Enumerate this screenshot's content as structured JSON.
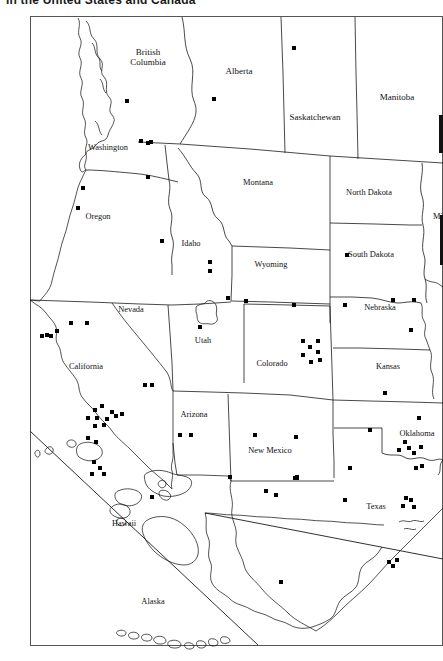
{
  "title": "in the United States and Canada",
  "map": {
    "type": "dot-distribution-map",
    "region": "Western United States and Canada",
    "frame": {
      "x": 30,
      "y": 16,
      "width": 413,
      "height": 630
    },
    "provinces": [
      {
        "name": "British Columbia",
        "x": 148,
        "y": 55,
        "two_line": true,
        "line1": "British",
        "line2": "Columbia"
      },
      {
        "name": "Alberta",
        "x": 239,
        "y": 74
      },
      {
        "name": "Saskatchewan",
        "x": 315,
        "y": 120
      },
      {
        "name": "Manitoba",
        "x": 397,
        "y": 100
      }
    ],
    "states": [
      {
        "name": "Washington",
        "x": 108,
        "y": 150
      },
      {
        "name": "Oregon",
        "x": 98,
        "y": 219
      },
      {
        "name": "Idaho",
        "x": 191,
        "y": 246
      },
      {
        "name": "Montana",
        "x": 258,
        "y": 185
      },
      {
        "name": "North Dakota",
        "x": 369,
        "y": 195
      },
      {
        "name": "South Dakota",
        "x": 371,
        "y": 257
      },
      {
        "name": "Nebraska",
        "x": 380,
        "y": 310
      },
      {
        "name": "Wyoming",
        "x": 271,
        "y": 267
      },
      {
        "name": "Nevada",
        "x": 131,
        "y": 312
      },
      {
        "name": "Utah",
        "x": 203,
        "y": 343
      },
      {
        "name": "Colorado",
        "x": 272,
        "y": 366
      },
      {
        "name": "Kansas",
        "x": 388,
        "y": 369
      },
      {
        "name": "California",
        "x": 86,
        "y": 369
      },
      {
        "name": "Arizona",
        "x": 194,
        "y": 417
      },
      {
        "name": "New Mexico",
        "x": 270,
        "y": 453
      },
      {
        "name": "Oklahoma",
        "x": 417,
        "y": 436
      },
      {
        "name": "Texas",
        "x": 376,
        "y": 509
      },
      {
        "name": "Hawaii",
        "x": 124,
        "y": 526
      },
      {
        "name": "Alaska",
        "x": 153,
        "y": 604
      },
      {
        "name": "Mi",
        "x": 438,
        "y": 219,
        "clipped": true
      }
    ],
    "dots": {
      "marker": "filled-square",
      "size_px": 4,
      "count": 96,
      "points": [
        [
          127,
          101
        ],
        [
          214,
          99
        ],
        [
          294,
          48
        ],
        [
          141,
          141
        ],
        [
          148,
          143
        ],
        [
          151,
          142
        ],
        [
          83,
          188
        ],
        [
          78,
          208
        ],
        [
          162,
          241
        ],
        [
          294,
          305
        ],
        [
          345,
          305
        ],
        [
          347,
          255
        ],
        [
          393,
          300
        ],
        [
          414,
          300
        ],
        [
          411,
          330
        ],
        [
          385,
          393
        ],
        [
          246,
          301
        ],
        [
          228,
          298
        ],
        [
          200,
          327
        ],
        [
          71,
          323
        ],
        [
          87,
          323
        ],
        [
          47,
          335
        ],
        [
          51,
          336
        ],
        [
          57,
          331
        ],
        [
          42,
          336
        ],
        [
          95,
          410
        ],
        [
          102,
          406
        ],
        [
          112,
          412
        ],
        [
          88,
          418
        ],
        [
          97,
          418
        ],
        [
          107,
          419
        ],
        [
          116,
          416
        ],
        [
          122,
          414
        ],
        [
          95,
          426
        ],
        [
          104,
          425
        ],
        [
          88,
          438
        ],
        [
          96,
          442
        ],
        [
          94,
          462
        ],
        [
          100,
          468
        ],
        [
          92,
          474
        ],
        [
          104,
          474
        ],
        [
          145,
          385
        ],
        [
          152,
          385
        ],
        [
          180,
          435
        ],
        [
          191,
          435
        ],
        [
          210,
          262
        ],
        [
          210,
          271
        ],
        [
          303,
          341
        ],
        [
          310,
          347
        ],
        [
          318,
          341
        ],
        [
          318,
          352
        ],
        [
          303,
          355
        ],
        [
          311,
          362
        ],
        [
          320,
          360
        ],
        [
          255,
          435
        ],
        [
          296,
          437
        ],
        [
          295,
          478
        ],
        [
          297,
          478
        ],
        [
          297,
          477
        ],
        [
          230,
          477
        ],
        [
          266,
          491
        ],
        [
          276,
          495
        ],
        [
          370,
          430
        ],
        [
          350,
          468
        ],
        [
          419,
          418
        ],
        [
          405,
          442
        ],
        [
          399,
          450
        ],
        [
          409,
          448
        ],
        [
          414,
          453
        ],
        [
          421,
          447
        ],
        [
          416,
          468
        ],
        [
          422,
          466
        ],
        [
          389,
          562
        ],
        [
          397,
          560
        ],
        [
          393,
          566
        ],
        [
          406,
          498
        ],
        [
          403,
          506
        ],
        [
          411,
          500
        ],
        [
          414,
          507
        ],
        [
          152,
          497
        ],
        [
          281,
          582
        ],
        [
          148,
          177
        ],
        [
          345,
          500
        ]
      ]
    }
  }
}
